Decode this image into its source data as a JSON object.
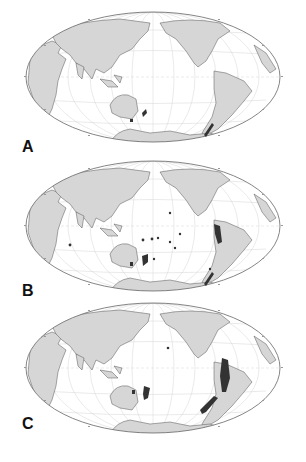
{
  "figure": {
    "projection": "Hammer (Pacific-centered world map)",
    "colors": {
      "land": "#d6d6d6",
      "land_stroke": "#555555",
      "ocean": "#ffffff",
      "graticule": "#cfcfcf",
      "highlight": "#333333",
      "border": "#666666"
    },
    "panels": [
      {
        "label": "A",
        "description": "World map with highlighted regions along southern Chile, New Zealand and Tasmania",
        "highlights": [
          "southern-chile",
          "new-zealand-south",
          "tasmania"
        ]
      },
      {
        "label": "B",
        "description": "World map with highlighted regions along the Andes, southern Chile, New Zealand, Tasmania and scattered Pacific islands",
        "highlights": [
          "andes-north",
          "southern-chile",
          "new-zealand",
          "tasmania",
          "pacific-islands",
          "madagascar-area"
        ]
      },
      {
        "label": "C",
        "description": "World map with extensive highlighted regions along the Andes, southern Chile, New Zealand and Tasmania",
        "highlights": [
          "andes-north-extensive",
          "southern-chile-extensive",
          "new-zealand",
          "tasmania",
          "hawaii"
        ]
      }
    ]
  }
}
